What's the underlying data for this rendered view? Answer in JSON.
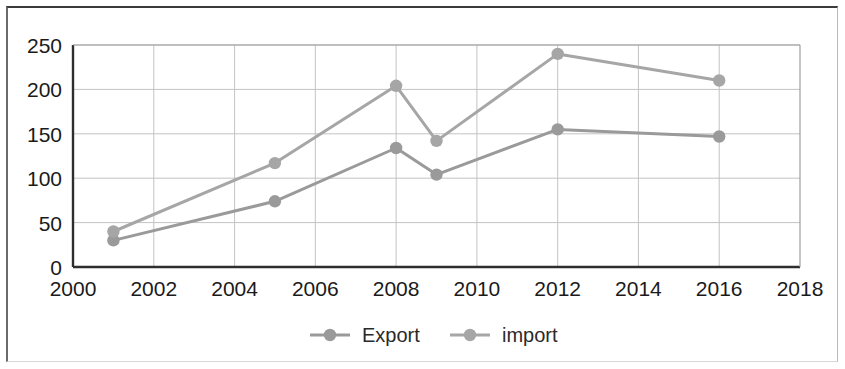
{
  "chart_data": {
    "type": "line",
    "title": "",
    "subtitle": "",
    "xlabel": "",
    "ylabel": "",
    "xlim": [
      2000,
      2018
    ],
    "ylim": [
      0,
      250
    ],
    "x_tick_labels": [
      "2000",
      "2002",
      "2004",
      "2006",
      "2008",
      "2010",
      "2012",
      "2014",
      "2016",
      "2018"
    ],
    "x_ticks": [
      2000,
      2002,
      2004,
      2006,
      2008,
      2010,
      2012,
      2014,
      2016,
      2018
    ],
    "y_tick_labels": [
      "0",
      "50",
      "100",
      "150",
      "200",
      "250"
    ],
    "y_ticks": [
      0,
      50,
      100,
      150,
      200,
      250
    ],
    "grid": "horizontal-and-vertical",
    "legend_position": "bottom-center",
    "x": [
      2001,
      2005,
      2008,
      2009,
      2012,
      2016
    ],
    "series": [
      {
        "name": "Export",
        "color": "#9a9a9a",
        "marker": "circle",
        "values": [
          30,
          74,
          134,
          104,
          155,
          147
        ]
      },
      {
        "name": "import",
        "color": "#a6a6a6",
        "marker": "circle",
        "values": [
          40,
          117,
          204,
          142,
          240,
          210
        ]
      }
    ],
    "annotations": []
  },
  "legend": {
    "entries": [
      {
        "label": "Export"
      },
      {
        "label": "import"
      }
    ]
  },
  "colors": {
    "export_series": "#9a9a9a",
    "import_series": "#a6a6a6",
    "gridline": "#c3c3c3",
    "axis": "#2e2e2e",
    "tick_text": "#1a1a1a",
    "page_background": "#ffffff",
    "document_border": "#3b3b3b"
  }
}
